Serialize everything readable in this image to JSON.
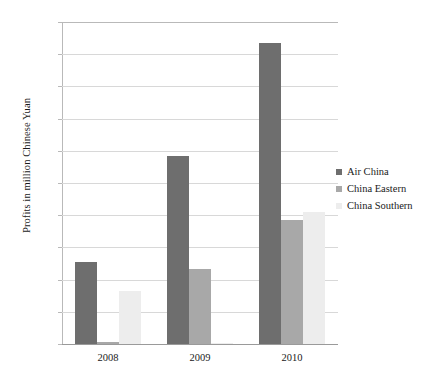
{
  "chart_data": {
    "type": "bar",
    "title": "",
    "subtitle": "",
    "xlabel": "",
    "ylabel": "Profits in million Chinese Yuan",
    "categories": [
      "2008",
      "2009",
      "2010"
    ],
    "series": [
      {
        "name": "Air China",
        "color": "#6e6e6e",
        "values": [
          1280,
          2920,
          4670
        ]
      },
      {
        "name": "China Eastern",
        "color": "#a8a8a8",
        "values": [
          30,
          1160,
          1920
        ]
      },
      {
        "name": "China Southern",
        "color": "#ededed",
        "values": [
          820,
          15,
          2050
        ]
      }
    ],
    "ylim": [
      0,
      5000
    ],
    "ytick_values": [
      0,
      500,
      1000,
      1500,
      2000,
      2500,
      3000,
      3500,
      4000,
      4500,
      5000
    ],
    "ytick_labels": [
      "0",
      "500",
      "1,000",
      "1,500",
      "2,000",
      "2,500",
      "3,000",
      "3,500",
      "4,000",
      "4,500",
      "5,000"
    ],
    "grid": true,
    "legend_position": "right"
  },
  "legend": {
    "items": [
      {
        "label": "Air China"
      },
      {
        "label": "China Eastern"
      },
      {
        "label": "China Southern"
      }
    ]
  }
}
